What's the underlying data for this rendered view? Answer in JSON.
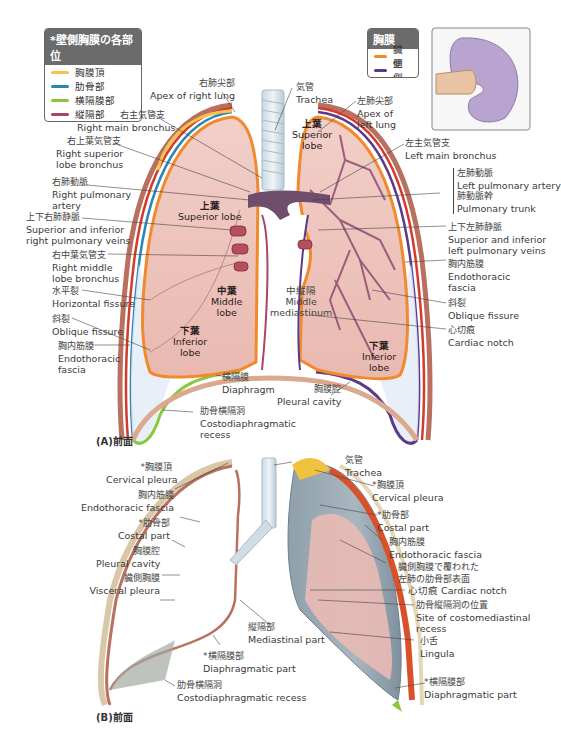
{
  "legend_parietal": {
    "title": "*壁側胸膜の各部位",
    "items": [
      {
        "label": "胸膜頂",
        "color": "#f4c34a"
      },
      {
        "label": "肋骨部",
        "color": "#2b86b5"
      },
      {
        "label": "横隔膜部",
        "color": "#8cc63f"
      },
      {
        "label": "縦隔部",
        "color": "#a8456a"
      }
    ]
  },
  "legend_pleura": {
    "title": "胸膜",
    "items": [
      {
        "label": "臓側",
        "color": "#f08a2c"
      },
      {
        "label": "壁側",
        "color": "#5b3a8a"
      }
    ]
  },
  "inset": {
    "description": "fist-in-balloon analogy",
    "balloon_color": "#b9a3cf",
    "frame_color": "#888888"
  },
  "panel_a": {
    "caption": "(A)前面",
    "organs": {
      "right_superior": {
        "jp": "上葉",
        "en": "Superior lobe"
      },
      "right_middle": {
        "jp": "中葉",
        "en1": "Middle",
        "en2": "lobe"
      },
      "right_inferior": {
        "jp": "下葉",
        "en1": "Inferior",
        "en2": "lobe"
      },
      "left_superior": {
        "jp": "上葉",
        "en1": "Superior",
        "en2": "lobe"
      },
      "left_inferior": {
        "jp": "下葉",
        "en1": "Inferior",
        "en2": "lobe"
      },
      "mediastinum": {
        "jp": "中縦隔",
        "en1": "Middle",
        "en2": "mediastinum"
      }
    },
    "labels": {
      "apex_right": {
        "jp": "右肺尖部",
        "en": "Apex of right lung"
      },
      "trachea": {
        "jp": "気管",
        "en": "Trachea"
      },
      "apex_left": {
        "jp": "左肺尖部",
        "en1": "Apex of",
        "en2": "left lung"
      },
      "right_main_bronchus": {
        "jp": "右主気管支",
        "en": "Right main bronchus"
      },
      "right_superior_lobe_bronchus": {
        "jp": "右上葉気管支",
        "en1": "Right superior",
        "en2": "lobe bronchus"
      },
      "right_pulmonary_artery": {
        "jp": "右肺動脈",
        "en1": "Right pulmonary",
        "en2": "artery"
      },
      "right_pulmonary_veins": {
        "jp": "上下右肺静脈",
        "en1": "Superior and inferior",
        "en2": "right pulmonary veins"
      },
      "right_middle_lobe_bronchus": {
        "jp": "右中葉気管支",
        "en1": "Right middle",
        "en2": "lobe bronchus"
      },
      "horizontal_fissure": {
        "jp": "水平裂",
        "en": "Horizontal fissure"
      },
      "oblique_fissure_right": {
        "jp": "斜裂",
        "en": "Oblique fissure"
      },
      "endothoracic_fascia_right": {
        "jp": "胸内筋膜",
        "en1": "Endothoracic",
        "en2": "fascia"
      },
      "left_main_bronchus": {
        "jp": "左主気管支",
        "en": "Left main bronchus"
      },
      "left_pulmonary_artery": {
        "jp": "左肺動脈",
        "en": "Left pulmonary artery"
      },
      "pulmonary_trunk": {
        "jp": "肺動脈幹",
        "en": "Pulmonary trunk"
      },
      "left_pulmonary_veins": {
        "jp": "上下左肺静脈",
        "en1": "Superior and inferior",
        "en2": "left pulmonary veins"
      },
      "endothoracic_fascia_left": {
        "jp": "胸内筋膜",
        "en1": "Endothoracic",
        "en2": "fascia"
      },
      "oblique_fissure_left": {
        "jp": "斜裂",
        "en": "Oblique fissure"
      },
      "cardiac_notch": {
        "jp": "心切痕",
        "en": "Cardiac notch"
      },
      "diaphragm": {
        "jp": "横隔膜",
        "en": "Diaphragm"
      },
      "pleural_cavity": {
        "jp": "胸膜腔",
        "en": "Pleural cavity"
      },
      "costodiaphragmatic_recess": {
        "jp": "肋骨横隔洞",
        "en1": "Costodiaphragmatic",
        "en2": "recess"
      }
    }
  },
  "panel_b": {
    "caption": "(B)前面",
    "labels": {
      "cervical_pleura_left": {
        "jp": "*胸膜頂",
        "en": "Cervical pleura"
      },
      "endothoracic_fascia_left": {
        "jp": "胸内筋膜",
        "en": "Endothoracic fascia"
      },
      "costal_part_left": {
        "jp": "*肋骨部",
        "en": "Costal part"
      },
      "pleural_cavity": {
        "jp": "胸膜腔",
        "en": "Pleural cavity"
      },
      "visceral_pleura": {
        "jp": "臓側胸膜",
        "en": "Visceral pleura"
      },
      "mediastinal_part": {
        "jp": "縦隔部",
        "en": "Mediastinal part"
      },
      "diaphragmatic_part_left": {
        "jp": "*横隔膜部",
        "en": "Diaphragmatic part"
      },
      "costodiaphragmatic_recess": {
        "jp": "肋骨横隔洞",
        "en": "Costodiaphragmatic recess"
      },
      "trachea": {
        "jp": "気管",
        "en": "Trachea"
      },
      "cervical_pleura_right": {
        "jp": "*胸膜頂",
        "en": "Cervical pleura"
      },
      "costal_part_right": {
        "jp": "*肋骨部",
        "en": "Costal part"
      },
      "endothoracic_fascia_right": {
        "jp": "胸内筋膜",
        "en": "Endothoracic fascia"
      },
      "visceral_covered": {
        "jp1": "臓側胸膜で覆われた",
        "jp2": "左肺の肋骨部表面"
      },
      "cardiac_notch": {
        "jp": "心切痕",
        "en": "Cardiac notch"
      },
      "costomediastinal_recess": {
        "jp": "肋骨縦隔洞の位置",
        "en1": "Site of costomediastinal",
        "en2": "recess"
      },
      "lingula": {
        "jp": "小舌",
        "en": "Lingula"
      },
      "diaphragmatic_part_right": {
        "jp": "*横隔膜部",
        "en": "Diaphragmatic part"
      }
    }
  }
}
